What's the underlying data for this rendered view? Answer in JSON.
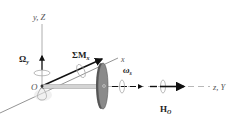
{
  "diagram": {
    "labels": {
      "vertical_axis": "y, Z",
      "precession_rate": "Ω",
      "precession_sub": "y",
      "moment": "ΣM",
      "moment_sub": "x",
      "x_axis": "x",
      "spin_rate": "ω",
      "spin_sub": "s",
      "horizontal_axis": "z, Y",
      "origin": "O",
      "angular_momentum": "H",
      "angular_momentum_sub": "O"
    },
    "colors": {
      "axis": "#888888",
      "vector": "#111111",
      "disk_fill": "#8a8a8a",
      "disk_edge": "#555555",
      "rod": "#c8c8c8",
      "rotation_arrow": "#aaaaaa"
    }
  }
}
